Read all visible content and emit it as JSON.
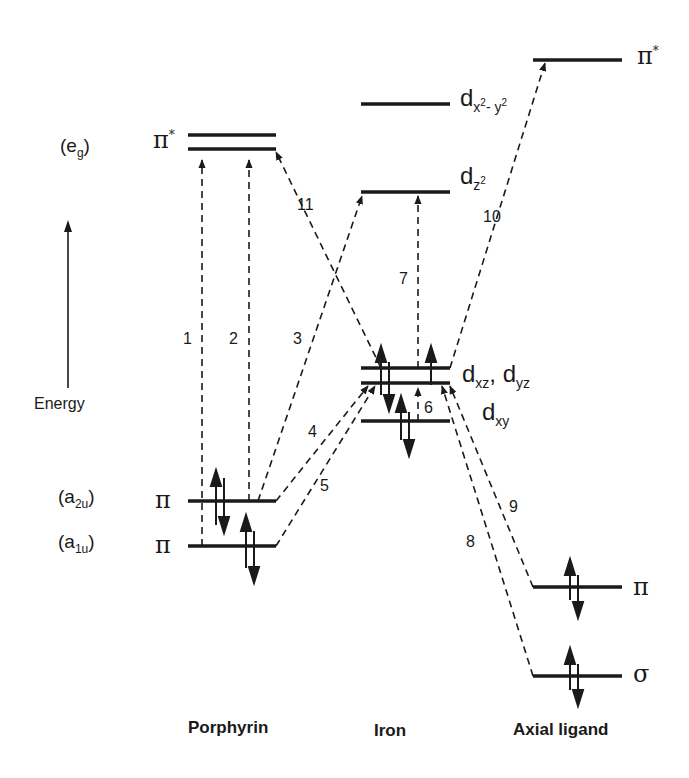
{
  "diagram": {
    "type": "molecular-orbital-energy-level-diagram",
    "axis": {
      "label": "Energy",
      "direction": "up"
    },
    "columns": [
      {
        "id": "porphyrin",
        "label": "Porphyrin"
      },
      {
        "id": "iron",
        "label": "Iron"
      },
      {
        "id": "axial",
        "label": "Axial ligand"
      }
    ],
    "levels": {
      "porphyrin": [
        {
          "symbol": "π*",
          "sym_label": "(e",
          "sym_sub": "g",
          "sym_close": ")",
          "electrons": 0
        },
        {
          "symbol": "π",
          "sym_label": "(a",
          "sym_sub": "2u",
          "sym_close": ")",
          "electrons": 2
        },
        {
          "symbol": "π",
          "sym_label": "(a",
          "sym_sub": "1u",
          "sym_close": ")",
          "electrons": 2
        }
      ],
      "iron": [
        {
          "label": "d",
          "sub": "x²- y²",
          "electrons": 0
        },
        {
          "label": "d",
          "sub": "z²",
          "electrons": 0
        },
        {
          "label": "d",
          "sub1": "xz",
          "sep": ", d",
          "sub2": "yz",
          "electrons": 2
        },
        {
          "label": "d",
          "sub": "xy",
          "electrons": 2
        }
      ],
      "axial": [
        {
          "symbol": "π*",
          "electrons": 0
        },
        {
          "symbol": "π",
          "electrons": 2
        },
        {
          "symbol": "σ",
          "electrons": 2
        }
      ]
    },
    "transitions": [
      {
        "n": "1",
        "from": "porphyrin a1u π",
        "to": "porphyrin π*"
      },
      {
        "n": "2",
        "from": "porphyrin a2u π",
        "to": "porphyrin π*"
      },
      {
        "n": "3",
        "from": "porphyrin a2u π",
        "to": "iron dz²"
      },
      {
        "n": "4",
        "from": "porphyrin a2u π",
        "to": "iron dxz,dyz"
      },
      {
        "n": "5",
        "from": "porphyrin a1u π",
        "to": "iron dxz,dyz"
      },
      {
        "n": "6",
        "from": "iron dxy",
        "to": "iron dxz,dyz"
      },
      {
        "n": "7",
        "from": "iron dxz,dyz",
        "to": "iron dz²"
      },
      {
        "n": "8",
        "from": "axial σ",
        "to": "iron dxz,dyz"
      },
      {
        "n": "9",
        "from": "axial π",
        "to": "iron dxz,dyz"
      },
      {
        "n": "10",
        "from": "iron dxz,dyz",
        "to": "axial π*"
      },
      {
        "n": "11",
        "from": "iron dxz,dyz",
        "to": "porphyrin π*"
      }
    ]
  }
}
